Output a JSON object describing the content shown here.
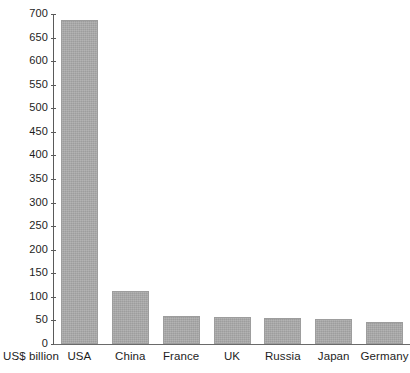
{
  "chart_data": {
    "type": "bar",
    "title": "",
    "subtitle": "",
    "xlabel": "",
    "ylabel": "US$ billion",
    "categories": [
      "USA",
      "China",
      "France",
      "UK",
      "Russia",
      "Japan",
      "Germany"
    ],
    "values": [
      687,
      113,
      60,
      58,
      55,
      54,
      47
    ],
    "ylim": [
      0,
      700
    ],
    "ytick_step": 50,
    "yticks": [
      0,
      50,
      100,
      150,
      200,
      250,
      300,
      350,
      400,
      450,
      500,
      550,
      600,
      650,
      700
    ],
    "ytick_labels": [
      "0",
      "50",
      "100",
      "150",
      "200",
      "250",
      "300",
      "350",
      "400",
      "450",
      "500",
      "550",
      "600",
      "650",
      "700"
    ],
    "grid": false,
    "legend": null,
    "legend_position": "none",
    "series": [
      {
        "name": "Military expenditure",
        "values": [
          687,
          113,
          60,
          58,
          55,
          54,
          47
        ]
      }
    ],
    "colors": {
      "bar_fill": "#ababab",
      "bar_border": "#9d9d9d",
      "axis": "#5a5a5a",
      "text": "#1d1d1d",
      "background": "#ffffff"
    }
  }
}
